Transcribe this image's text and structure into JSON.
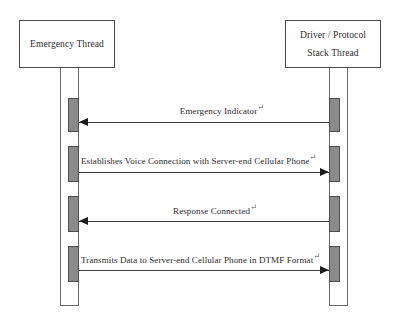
{
  "diagram": {
    "type": "uml-sequence-diagram",
    "line_break_mark": "↵",
    "colors": {
      "activation_fill": "#8a8a8a",
      "activation_border": "#4f4f4f",
      "box_border": "#4a4a4a",
      "line": "#3a3a3a",
      "text": "#2b2b2b",
      "background": "#ffffff"
    },
    "participants": [
      {
        "id": "emergency-thread",
        "lines": [
          "Emergency Thread"
        ],
        "box": {
          "x": 19,
          "y": 20,
          "width": 96,
          "height": 48
        },
        "lifeline": {
          "x": 60,
          "y": 68,
          "width": 19,
          "height": 238
        },
        "activation_x": 68,
        "activation_width": 11
      },
      {
        "id": "driver-protocol-stack-thread",
        "lines": [
          "Driver / Protocol",
          "Stack Thread"
        ],
        "box": {
          "x": 285,
          "y": 20,
          "width": 96,
          "height": 48
        },
        "lifeline": {
          "x": 329,
          "y": 68,
          "width": 19,
          "height": 238
        },
        "activation_x": 329,
        "activation_width": 11
      }
    ],
    "messages": [
      {
        "index": 1,
        "label": "Emergency Indicator",
        "direction": "right-to-left",
        "from": "driver-protocol-stack-thread",
        "to": "emergency-thread",
        "line_y": 122,
        "label_x": 222,
        "label_y": 103,
        "activation_top": 98,
        "activation_height": 34
      },
      {
        "index": 2,
        "label": "Establishes Voice Connection with Server-end Cellular Phone",
        "direction": "left-to-right",
        "from": "emergency-thread",
        "to": "driver-protocol-stack-thread",
        "line_y": 172,
        "label_x": 81,
        "label_y": 153,
        "activation_top": 146,
        "activation_height": 36
      },
      {
        "index": 3,
        "label": "Response Connected",
        "direction": "right-to-left",
        "from": "driver-protocol-stack-thread",
        "to": "emergency-thread",
        "line_y": 221,
        "label_x": 215,
        "label_y": 203,
        "activation_top": 196,
        "activation_height": 36
      },
      {
        "index": 4,
        "label": "Transmits Data to Server-end Cellular Phone in DTMF Format",
        "direction": "left-to-right",
        "from": "emergency-thread",
        "to": "driver-protocol-stack-thread",
        "line_y": 270,
        "label_x": 81,
        "label_y": 252,
        "activation_top": 246,
        "activation_height": 36
      }
    ]
  }
}
